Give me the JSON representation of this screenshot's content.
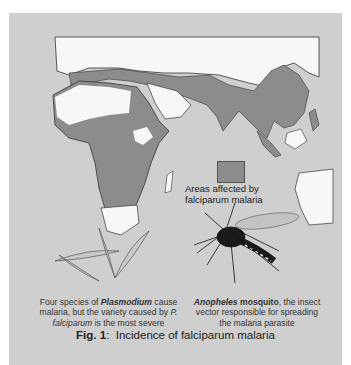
{
  "figure": {
    "number_label": "Fig. 1",
    "separator": ":",
    "title": "Incidence of falciparum malaria"
  },
  "legend": {
    "swatch_color": "#8c8c8c",
    "label": "Areas affected by falciparum malaria"
  },
  "captions": {
    "plasmodium": {
      "part1": "Four species of ",
      "bold_italic": "Plasmodium",
      "part2": " cause malaria, but the variety caused by ",
      "italic": "P. falciparum",
      "part3": " is the most severe"
    },
    "mosquito": {
      "bold_italic": "Anopheles",
      "bold": " mosquito",
      "part1": ", the insect vector responsible for spreading the malaria parasite"
    }
  },
  "colors": {
    "background": "#cfcfcf",
    "land_unaffected": "#f7f7f7",
    "land_affected": "#8c8c8c",
    "outline": "#333333"
  },
  "map_regions": [
    "Europe",
    "Africa",
    "Middle East",
    "South Asia",
    "Southeast Asia",
    "East Asia",
    "Australia"
  ]
}
